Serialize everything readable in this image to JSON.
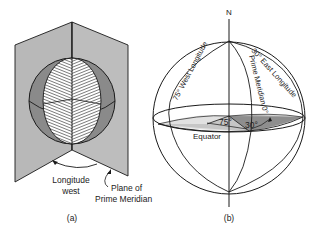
{
  "figure_a": {
    "label": "(a)",
    "annotation_longitude_line1": "Longitude",
    "annotation_longitude_line2": "west",
    "annotation_plane_line1": "Plane of",
    "annotation_plane_line2": "Prime Meridian"
  },
  "figure_b": {
    "label": "(b)",
    "north_label": "N",
    "west_longitude_label": "75° West Longitude",
    "east_longitude_label": "30° East Longitude",
    "prime_meridian_label": "Prime Meridian 0°",
    "equator_label": "Equator",
    "angle_west": "75°",
    "angle_east": "30°"
  },
  "colors": {
    "plane_fill": "#b8b8b8",
    "sphere_dark": "#8a8a8a",
    "wedge_light": "#c4c4c4",
    "wedge_dark": "#8e8e8e",
    "stroke": "#1a1a1a"
  }
}
